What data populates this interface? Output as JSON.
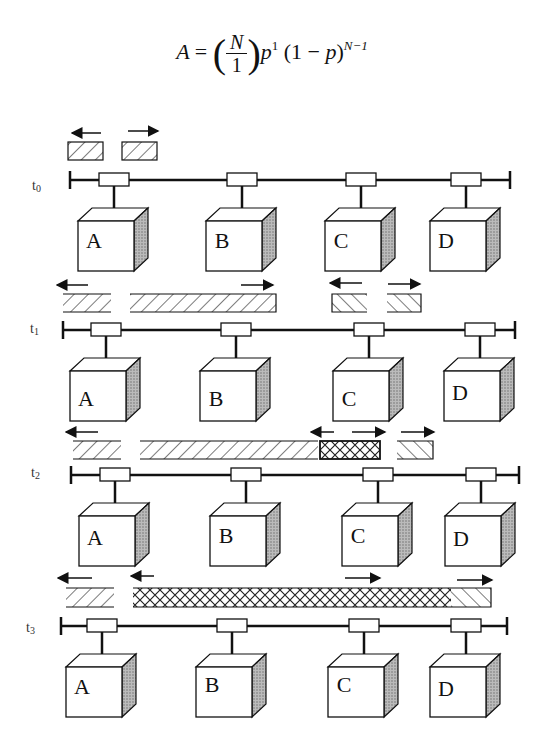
{
  "formula": {
    "lhs": "A",
    "eq": "=",
    "numerator": "N",
    "denominator": "1",
    "p": "p",
    "p_exp": "1",
    "factor": "(1 − p)",
    "factor_exp": "N−1"
  },
  "stations": [
    "A",
    "B",
    "C",
    "D"
  ],
  "timesteps": [
    {
      "label": "t0",
      "label_main": "t",
      "label_sub": "0"
    },
    {
      "label": "t1",
      "label_main": "t",
      "label_sub": "1"
    },
    {
      "label": "t2",
      "label_main": "t",
      "label_sub": "2"
    },
    {
      "label": "t3",
      "label_main": "t",
      "label_sub": "3"
    }
  ]
}
